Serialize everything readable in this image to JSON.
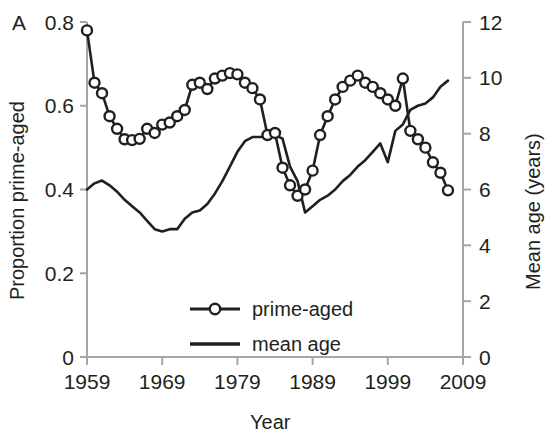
{
  "figure": {
    "panel_label": "A",
    "background": "#ffffff",
    "line_color": "#231f20",
    "axis_color": "#a6a6a6"
  },
  "chart_data": {
    "type": "line",
    "title": "",
    "xlabel": "Year",
    "ylabel": "Proportion prime-aged",
    "y2label": "Mean age (years)",
    "xlim": [
      1959,
      2009
    ],
    "ylim": [
      0,
      0.8
    ],
    "y2lim": [
      0,
      12
    ],
    "xticks": [
      1959,
      1969,
      1979,
      1989,
      1999,
      2009
    ],
    "xtick_labels": [
      "1959",
      "1969",
      "1979",
      "1989",
      "1999",
      "2009"
    ],
    "yticks": [
      0,
      0.2,
      0.4,
      0.6,
      0.8
    ],
    "ytick_labels": [
      "0",
      "0.2",
      "0.4",
      "0.6",
      "0.8"
    ],
    "y2ticks": [
      0,
      2,
      4,
      6,
      8,
      10,
      12
    ],
    "y2tick_labels": [
      "0",
      "2",
      "4",
      "6",
      "8",
      "10",
      "12"
    ],
    "grid": false,
    "legend_position": "center",
    "legend": [
      "prime-aged",
      "mean age"
    ],
    "series": [
      {
        "name": "prime-aged",
        "axis": "left",
        "marker": "circle-open",
        "x": [
          1959,
          1960,
          1961,
          1962,
          1963,
          1964,
          1965,
          1966,
          1967,
          1968,
          1969,
          1970,
          1971,
          1972,
          1973,
          1974,
          1975,
          1976,
          1977,
          1978,
          1979,
          1980,
          1981,
          1982,
          1983,
          1984,
          1985,
          1986,
          1987,
          1988,
          1989,
          1990,
          1991,
          1992,
          1993,
          1994,
          1995,
          1996,
          1997,
          1998,
          1999,
          2000,
          2001,
          2002,
          2003,
          2004,
          2005,
          2006,
          2007
        ],
        "y": [
          0.78,
          0.655,
          0.63,
          0.575,
          0.545,
          0.52,
          0.518,
          0.521,
          0.545,
          0.535,
          0.555,
          0.56,
          0.575,
          0.59,
          0.65,
          0.655,
          0.64,
          0.665,
          0.672,
          0.678,
          0.675,
          0.655,
          0.642,
          0.615,
          0.53,
          0.535,
          0.452,
          0.41,
          0.385,
          0.4,
          0.445,
          0.53,
          0.575,
          0.615,
          0.645,
          0.66,
          0.672,
          0.655,
          0.645,
          0.63,
          0.615,
          0.6,
          0.665,
          0.54,
          0.52,
          0.5,
          0.465,
          0.44,
          0.398
        ],
        "y_right_equivalent": [
          11.7,
          9.83,
          9.45,
          8.63,
          8.18,
          7.8,
          7.77,
          7.82,
          8.18,
          8.03,
          8.33,
          8.4,
          8.63,
          8.85,
          9.75,
          9.83,
          9.6,
          9.98,
          10.08,
          10.17,
          10.13,
          9.83,
          9.63,
          9.23,
          7.95,
          8.03,
          6.78,
          6.15,
          5.78,
          6.0,
          6.68,
          7.95,
          8.63,
          9.23,
          9.68,
          9.9,
          10.08,
          9.83,
          9.68,
          9.45,
          9.23,
          9.0,
          9.98,
          8.1,
          7.8,
          7.5,
          6.98,
          6.6,
          5.97
        ]
      },
      {
        "name": "mean age",
        "axis": "right",
        "marker": "none",
        "x": [
          1959,
          1960,
          1961,
          1962,
          1963,
          1964,
          1965,
          1966,
          1967,
          1968,
          1969,
          1970,
          1971,
          1972,
          1973,
          1974,
          1975,
          1976,
          1977,
          1978,
          1979,
          1980,
          1981,
          1982,
          1983,
          1984,
          1985,
          1986,
          1987,
          1988,
          1989,
          1990,
          1991,
          1992,
          1993,
          1994,
          1995,
          1996,
          1997,
          1998,
          1999,
          2000,
          2001,
          2002,
          2003,
          2004,
          2005,
          2006,
          2007
        ],
        "y_right": [
          6.0,
          6.22,
          6.32,
          6.15,
          5.92,
          5.63,
          5.4,
          5.18,
          4.88,
          4.58,
          4.5,
          4.58,
          4.58,
          4.95,
          5.18,
          5.25,
          5.48,
          5.85,
          6.3,
          6.82,
          7.35,
          7.73,
          7.88,
          7.88,
          7.88,
          7.95,
          7.82,
          6.82,
          6.3,
          5.18,
          5.4,
          5.63,
          5.78,
          6.0,
          6.3,
          6.52,
          6.82,
          7.05,
          7.35,
          7.65,
          6.98,
          8.1,
          8.33,
          8.85,
          9.0,
          9.08,
          9.3,
          9.68,
          9.9
        ],
        "y_left_equivalent": [
          0.4,
          0.415,
          0.421,
          0.41,
          0.395,
          0.375,
          0.36,
          0.345,
          0.325,
          0.305,
          0.3,
          0.305,
          0.305,
          0.33,
          0.345,
          0.35,
          0.365,
          0.39,
          0.42,
          0.455,
          0.49,
          0.515,
          0.525,
          0.525,
          0.525,
          0.53,
          0.521,
          0.455,
          0.42,
          0.345,
          0.36,
          0.375,
          0.385,
          0.4,
          0.42,
          0.435,
          0.455,
          0.47,
          0.49,
          0.51,
          0.465,
          0.54,
          0.555,
          0.59,
          0.6,
          0.605,
          0.62,
          0.645,
          0.66
        ]
      }
    ]
  }
}
